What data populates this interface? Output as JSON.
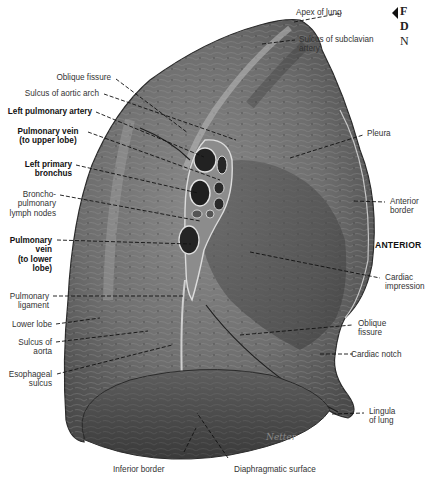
{
  "figure_ref": {
    "lines": [
      "F",
      "D",
      "N"
    ]
  },
  "orientation_label": "ANTERIOR",
  "signature": "Netter",
  "labels_left": [
    {
      "id": "oblique-fissure-upper",
      "text": [
        "Oblique fissure"
      ],
      "bold": false
    },
    {
      "id": "sulcus-aortic-arch",
      "text": [
        "Sulcus of aortic arch"
      ],
      "bold": false
    },
    {
      "id": "left-pulmonary-artery",
      "text": [
        "Left pulmonary artery"
      ],
      "bold": true
    },
    {
      "id": "pulmonary-vein-upper",
      "text": [
        "Pulmonary vein",
        "(to upper lobe)"
      ],
      "bold": true
    },
    {
      "id": "left-primary-bronchus",
      "text": [
        "Left primary",
        "bronchus"
      ],
      "bold": true
    },
    {
      "id": "bronchopulmonary-lymph-nodes",
      "text": [
        "Broncho-",
        "pulmonary",
        "lymph nodes"
      ],
      "bold": false
    },
    {
      "id": "pulmonary-vein-lower",
      "text": [
        "Pulmonary",
        "vein",
        "(to lower",
        "lobe)"
      ],
      "bold": true
    },
    {
      "id": "pulmonary-ligament",
      "text": [
        "Pulmonary",
        "ligament"
      ],
      "bold": false
    },
    {
      "id": "lower-lobe",
      "text": [
        "Lower lobe"
      ],
      "bold": false
    },
    {
      "id": "sulcus-of-aorta",
      "text": [
        "Sulcus of",
        "aorta"
      ],
      "bold": false
    },
    {
      "id": "esophageal-sulcus",
      "text": [
        "Esophageal",
        "sulcus"
      ],
      "bold": false
    }
  ],
  "labels_right": [
    {
      "id": "apex-of-lung",
      "text": [
        "Apex of lung"
      ]
    },
    {
      "id": "sulcus-subclavian-artery",
      "text": [
        "Sulcus of subclavian",
        "artery"
      ]
    },
    {
      "id": "pleura",
      "text": [
        "Pleura"
      ]
    },
    {
      "id": "anterior-border",
      "text": [
        "Anterior",
        "border"
      ]
    },
    {
      "id": "cardiac-impression",
      "text": [
        "Cardiac",
        "impression"
      ]
    },
    {
      "id": "oblique-fissure-lower",
      "text": [
        "Oblique",
        "fissure"
      ]
    },
    {
      "id": "cardiac-notch",
      "text": [
        "Cardiac notch"
      ]
    },
    {
      "id": "lingula-of-lung",
      "text": [
        "Lingula",
        "of lung"
      ]
    }
  ],
  "labels_bottom": [
    {
      "id": "inferior-border",
      "text": [
        "Inferior border"
      ]
    },
    {
      "id": "diaphragmatic-surface",
      "text": [
        "Diaphragmatic surface"
      ]
    }
  ]
}
